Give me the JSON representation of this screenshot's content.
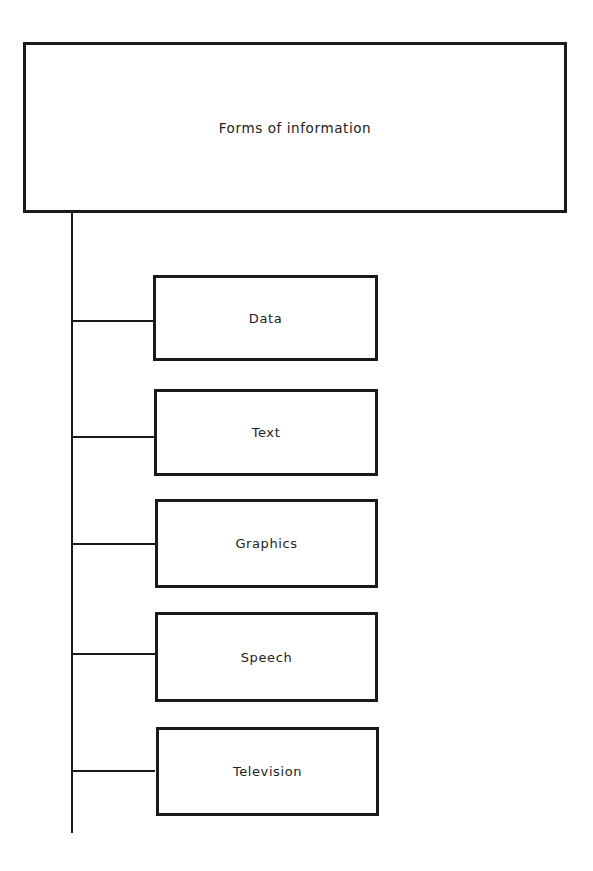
{
  "diagram": {
    "root": {
      "label": "Forms of information"
    },
    "children": [
      {
        "label": "Data"
      },
      {
        "label": "Text"
      },
      {
        "label": "Graphics"
      },
      {
        "label": "Speech"
      },
      {
        "label": "Television"
      }
    ]
  }
}
